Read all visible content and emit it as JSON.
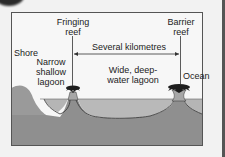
{
  "diagram": {
    "labels": {
      "fringing_reef": [
        "Fringing",
        "reef"
      ],
      "barrier_reef": [
        "Barrier",
        "reef"
      ],
      "distance": "Several kilometres",
      "shore": "Shore",
      "narrow_lagoon": [
        "Narrow",
        "shallow",
        "lagoon"
      ],
      "wide_lagoon": [
        "Wide, deep-",
        "water lagoon"
      ],
      "ocean": "Ocean"
    },
    "colors": {
      "background": "#f2f2f2",
      "frame_fill": "#f7f7f7",
      "frame_border": "#555555",
      "land": "#9a9a9a",
      "water": "#b9b9b9",
      "seabed": "#8f8f8f",
      "reef": "#a7a7a7",
      "palm": "#1e1e1e",
      "line": "#333333"
    }
  }
}
